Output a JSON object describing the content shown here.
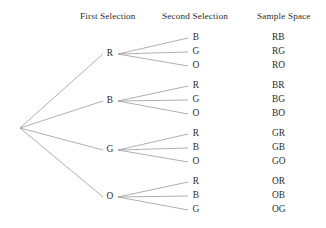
{
  "diagram": {
    "title_columns": {
      "first": "First Selection",
      "second": "Second Selection",
      "sample": "Sample Space"
    },
    "root": {
      "x": 20,
      "y": 128,
      "label": ""
    },
    "geometry": {
      "first_node_x": 110,
      "second_node_x": 196,
      "outcome_x": 272,
      "branch_start_x": 118,
      "branch_end_x": 188
    },
    "branches": [
      {
        "name": "branch-r",
        "first": {
          "label": "R",
          "x": 110,
          "y": 54
        },
        "seconds": [
          {
            "label": "B",
            "x": 196,
            "y": 38,
            "outcome": "RB"
          },
          {
            "label": "G",
            "x": 196,
            "y": 52,
            "outcome": "RG"
          },
          {
            "label": "O",
            "x": 196,
            "y": 66,
            "outcome": "RO"
          }
        ]
      },
      {
        "name": "branch-b",
        "first": {
          "label": "B",
          "x": 110,
          "y": 101
        },
        "seconds": [
          {
            "label": "R",
            "x": 196,
            "y": 86,
            "outcome": "BR"
          },
          {
            "label": "G",
            "x": 196,
            "y": 100,
            "outcome": "BG"
          },
          {
            "label": "O",
            "x": 196,
            "y": 114,
            "outcome": "BO"
          }
        ]
      },
      {
        "name": "branch-g",
        "first": {
          "label": "G",
          "x": 110,
          "y": 150
        },
        "seconds": [
          {
            "label": "R",
            "x": 196,
            "y": 134,
            "outcome": "GR"
          },
          {
            "label": "B",
            "x": 196,
            "y": 148,
            "outcome": "GB"
          },
          {
            "label": "O",
            "x": 196,
            "y": 162,
            "outcome": "GO"
          }
        ]
      },
      {
        "name": "branch-o",
        "first": {
          "label": "O",
          "x": 110,
          "y": 197
        },
        "seconds": [
          {
            "label": "R",
            "x": 196,
            "y": 182,
            "outcome": "OR"
          },
          {
            "label": "B",
            "x": 196,
            "y": 196,
            "outcome": "OB"
          },
          {
            "label": "G",
            "x": 196,
            "y": 210,
            "outcome": "OG"
          }
        ]
      }
    ],
    "colors": {
      "background": "#ffffff",
      "line": "#9a9a9a",
      "text": "#2b2b2b"
    }
  }
}
